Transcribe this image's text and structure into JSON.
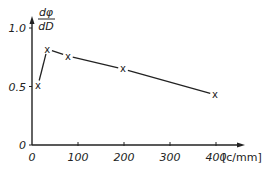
{
  "chart_data": {
    "type": "line",
    "title": "",
    "xlabel": "[c/mm]",
    "ylabel_numerator": "dφ",
    "ylabel_denominator": "dD",
    "x_ticks": [
      "0",
      "100",
      "200",
      "300",
      "400"
    ],
    "y_ticks": [
      "0",
      "0.5",
      "1.0"
    ],
    "xlim": [
      0,
      450
    ],
    "ylim": [
      0,
      1.1
    ],
    "grid": false,
    "legend": null,
    "marker": "x",
    "series": [
      {
        "name": "dφ/dD",
        "x": [
          13,
          33,
          78,
          198,
          398
        ],
        "y": [
          0.51,
          0.82,
          0.76,
          0.65,
          0.43
        ]
      }
    ]
  }
}
